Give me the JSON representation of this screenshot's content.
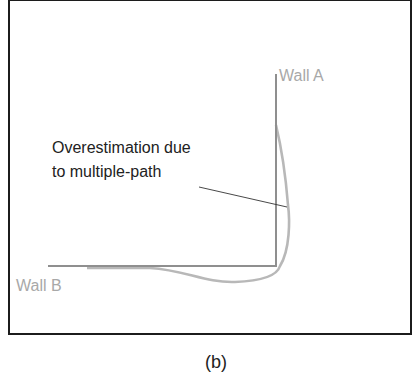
{
  "figure": {
    "caption": "(b)",
    "labels": {
      "wall_a": "Wall A",
      "wall_b": "Wall B",
      "annotation_line1": "Overestimation due",
      "annotation_line2": "to multiple-path"
    },
    "colors": {
      "wall_line": "#8f8f8f",
      "estimate_curve": "#b5b5b5",
      "label_text": "#a8a8a8",
      "annotation_text": "#222222",
      "frame": "#1c1c1c"
    }
  }
}
